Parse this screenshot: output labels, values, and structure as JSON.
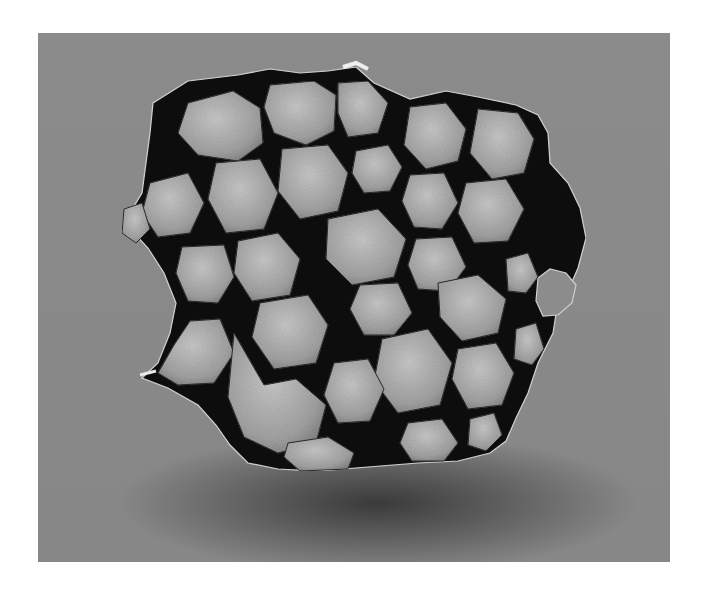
{
  "photo": {
    "subject": "pallasite meteorite slab",
    "description": "Cut slab with light olivine crystals in a dark iron-nickel metal matrix, on a gray photographic backdrop",
    "colors": {
      "backdrop": "#8a8a8a",
      "shadow": "#3a3a3a",
      "matrix": "#0e0e0e",
      "crystal_light": "#bdbdbd",
      "crystal_mid": "#9a9a9a",
      "rim_highlight": "#e0e0e0"
    }
  },
  "caption": {
    "text": ""
  }
}
